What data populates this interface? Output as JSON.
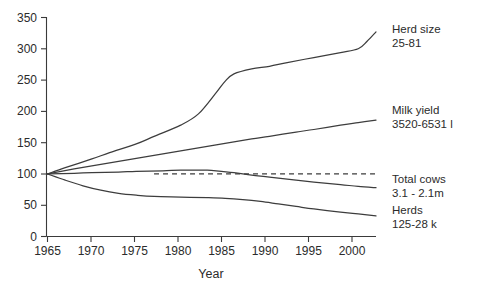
{
  "chart_data": {
    "type": "line",
    "title": "",
    "subtitle": "",
    "xlabel": "Year",
    "ylabel": "",
    "xlim": [
      1965,
      2002
    ],
    "ylim": [
      0,
      350
    ],
    "grid": false,
    "legend_position": "right-inline-annotations",
    "index_base": 100,
    "index_base_year": 1965,
    "x_ticks": [
      1965,
      1970,
      1975,
      1980,
      1985,
      1990,
      1995,
      2000
    ],
    "x_tick_labels": [
      "1965",
      "1970",
      "1975",
      "1980",
      "1985",
      "1990",
      "1995",
      "2000"
    ],
    "y_ticks": [
      0,
      50,
      100,
      150,
      200,
      250,
      300,
      350
    ],
    "y_tick_labels": [
      "0",
      "50",
      "100",
      "150",
      "200",
      "250",
      "300",
      "350"
    ],
    "reference_line": {
      "value": 100,
      "style": "dashed",
      "x_start": 1977,
      "x_end": 2002
    },
    "series": [
      {
        "name": "Herd size",
        "annotation_line1": "Herd size",
        "annotation_line2": "25-81",
        "range_start": 25,
        "range_end": 81,
        "x": [
          1965,
          1967,
          1970,
          1972,
          1975,
          1977,
          1980,
          1982,
          1984,
          1985,
          1986,
          1988,
          1990,
          1992,
          1995,
          1998,
          2000,
          2001,
          2002
        ],
        "values": [
          100,
          110,
          124,
          134,
          148,
          160,
          178,
          196,
          230,
          248,
          260,
          268,
          272,
          278,
          286,
          294,
          300,
          312,
          327
        ]
      },
      {
        "name": "Milk yield",
        "annotation_line1": "Milk yield",
        "annotation_line2": "3520-6531 l",
        "range_start": 3520,
        "range_end": 6531,
        "units": "l",
        "x": [
          1965,
          1968,
          1970,
          1973,
          1975,
          1978,
          1980,
          1983,
          1985,
          1988,
          1990,
          1993,
          1995,
          1998,
          2000,
          2002
        ],
        "values": [
          100,
          108,
          113,
          120,
          125,
          132,
          137,
          144,
          149,
          156,
          160,
          167,
          171,
          178,
          182,
          186
        ]
      },
      {
        "name": "Total cows",
        "annotation_line1": "Total cows",
        "annotation_line2": "3.1 - 2.1m",
        "range_start": 3.1,
        "range_end": 2.1,
        "units": "m",
        "x": [
          1965,
          1968,
          1970,
          1973,
          1975,
          1978,
          1980,
          1982,
          1983,
          1984,
          1986,
          1988,
          1990,
          1993,
          1995,
          1998,
          2000,
          2002
        ],
        "values": [
          100,
          101,
          102,
          103,
          104,
          105,
          106,
          106,
          106,
          105,
          102,
          98,
          95,
          90,
          87,
          83,
          80,
          78
        ]
      },
      {
        "name": "Herds",
        "annotation_line1": "Herds",
        "annotation_line2": "125-28 k",
        "range_start": 125,
        "range_end": 28,
        "units": "k",
        "x": [
          1965,
          1967,
          1969,
          1971,
          1973,
          1975,
          1977,
          1980,
          1983,
          1985,
          1987,
          1989,
          1991,
          1993,
          1995,
          1998,
          2000,
          2002
        ],
        "values": [
          100,
          90,
          81,
          74,
          69,
          66,
          64,
          63,
          62,
          61,
          59,
          56,
          52,
          48,
          44,
          39,
          36,
          33
        ]
      }
    ]
  },
  "annotations": {
    "herd_size": {
      "line1": "Herd size",
      "line2": "25-81"
    },
    "milk_yield": {
      "line1": "Milk yield",
      "line2": "3520-6531 l"
    },
    "total_cows": {
      "line1": "Total cows",
      "line2": "3.1 - 2.1m"
    },
    "herds": {
      "line1": "Herds",
      "line2": "125-28 k"
    }
  },
  "axis": {
    "x_title": "Year"
  }
}
